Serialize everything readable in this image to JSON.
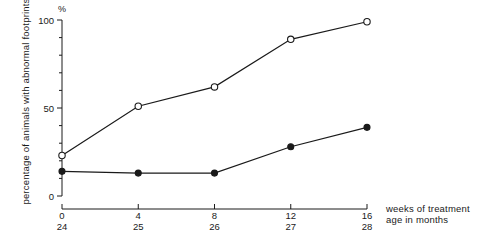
{
  "chart_data": {
    "type": "line",
    "title": "",
    "xlabel": "weeks of treatment",
    "xlabel_secondary": "age in months",
    "ylabel": "percentage of animals with abnormal footprints",
    "yunit": "%",
    "x": [
      0,
      4,
      8,
      12,
      16
    ],
    "x_tick_labels": [
      "0",
      "4",
      "8",
      "12",
      "16"
    ],
    "x_tick_labels_secondary": [
      "24",
      "25",
      "26",
      "27",
      "28"
    ],
    "y_tick_labels": [
      "0",
      "50",
      "100"
    ],
    "ylim": [
      0,
      100
    ],
    "y_major_ticks": [
      0,
      50,
      100
    ],
    "y_minor_ticks": [
      10,
      20,
      30,
      40,
      60,
      70,
      80,
      90
    ],
    "grid": false,
    "legend_position": "none",
    "series": [
      {
        "name": "open-circle-series",
        "marker": "open-circle",
        "values": [
          23,
          51,
          62,
          89,
          99
        ]
      },
      {
        "name": "filled-circle-series",
        "marker": "filled-circle",
        "values": [
          14,
          13,
          13,
          28,
          39
        ]
      }
    ]
  },
  "axis": {
    "y_unit_label": "%",
    "y_title": "percentage of animals with abnormal footprints",
    "x_title_primary": "weeks of treatment",
    "x_title_secondary": "age in months"
  },
  "colors": {
    "ink": "#1a1a1a",
    "background": "#ffffff"
  }
}
